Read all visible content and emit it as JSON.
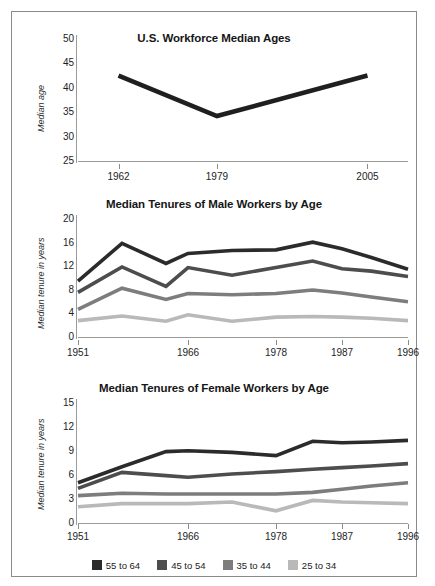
{
  "figure": {
    "border_color": "#8a8a8a",
    "background": "#ffffff"
  },
  "series_colors": {
    "55 to 64": "#2b2b2b",
    "45 to 54": "#4d4d4d",
    "35 to 44": "#7d7d7d",
    "25 to 34": "#b9b9b9",
    "single": "#1f1f1f"
  },
  "legend": {
    "position": "bottom",
    "items": [
      {
        "label": "55 to 64",
        "color": "#2b2b2b"
      },
      {
        "label": "45 to 54",
        "color": "#4d4d4d"
      },
      {
        "label": "35 to 44",
        "color": "#7d7d7d"
      },
      {
        "label": "25 to 34",
        "color": "#b9b9b9"
      }
    ]
  },
  "chart_data": [
    {
      "type": "line",
      "title": "U.S. Workforce Median Ages",
      "xlabel": "",
      "ylabel": "Median age",
      "x": [
        1962,
        1979,
        2005
      ],
      "xticks": [
        1962,
        1979,
        2005
      ],
      "xticklabels": [
        "1962",
        "1979",
        "2005"
      ],
      "yticks": [
        25,
        30,
        35,
        40,
        45,
        50
      ],
      "yticklabels": [
        "25",
        "30",
        "35",
        "40",
        "45",
        "50"
      ],
      "ylim": [
        25,
        50
      ],
      "xlim": [
        1955,
        2012
      ],
      "grid": false,
      "series": [
        {
          "name": "Median age",
          "color": "#1f1f1f",
          "values": [
            42.3,
            34.0,
            42.3
          ]
        }
      ]
    },
    {
      "type": "line",
      "title": "Median Tenures of Male Workers by Age",
      "xlabel": "",
      "ylabel": "Median tenure in years",
      "x": [
        1951,
        1957,
        1963,
        1966,
        1972,
        1978,
        1983,
        1987,
        1991,
        1996
      ],
      "xticks": [
        1951,
        1966,
        1978,
        1987,
        1996
      ],
      "xticklabels": [
        "1951",
        "1966",
        "1978",
        "1987",
        "1996"
      ],
      "yticks": [
        0,
        4,
        8,
        12,
        16,
        20
      ],
      "yticklabels": [
        "0",
        "4",
        "8",
        "12",
        "16",
        "20"
      ],
      "ylim": [
        0,
        20
      ],
      "grid": false,
      "series": [
        {
          "name": "55 to 64",
          "color": "#2b2b2b",
          "values": [
            9.3,
            15.7,
            12.3,
            14.0,
            14.5,
            14.6,
            15.9,
            14.8,
            13.3,
            11.3
          ]
        },
        {
          "name": "45 to 54",
          "color": "#4d4d4d",
          "values": [
            7.4,
            11.7,
            8.4,
            11.6,
            10.3,
            11.6,
            12.7,
            11.4,
            11.0,
            10.1
          ]
        },
        {
          "name": "35 to 44",
          "color": "#7d7d7d",
          "values": [
            4.5,
            8.1,
            6.2,
            7.2,
            7.0,
            7.2,
            7.8,
            7.3,
            6.6,
            5.8
          ]
        },
        {
          "name": "25 to 34",
          "color": "#b9b9b9",
          "values": [
            2.6,
            3.4,
            2.5,
            3.6,
            2.5,
            3.2,
            3.3,
            3.2,
            3.0,
            2.6
          ]
        }
      ]
    },
    {
      "type": "line",
      "title": "Median Tenures of Female Workers by Age",
      "xlabel": "",
      "ylabel": "Median tenure in years",
      "x": [
        1951,
        1957,
        1963,
        1966,
        1972,
        1978,
        1983,
        1987,
        1991,
        1996
      ],
      "xticks": [
        1951,
        1966,
        1978,
        1987,
        1996
      ],
      "xticklabels": [
        "1951",
        "1966",
        "1978",
        "1987",
        "1996"
      ],
      "yticks": [
        0,
        3,
        6,
        9,
        12,
        15
      ],
      "yticklabels": [
        "0",
        "3",
        "6",
        "9",
        "12",
        "15"
      ],
      "ylim": [
        0,
        15
      ],
      "grid": false,
      "series": [
        {
          "name": "55 to 64",
          "color": "#2b2b2b",
          "values": [
            4.9,
            6.9,
            8.8,
            8.9,
            8.7,
            8.3,
            10.1,
            9.9,
            10.0,
            10.2
          ]
        },
        {
          "name": "45 to 54",
          "color": "#4d4d4d",
          "values": [
            4.2,
            6.2,
            5.8,
            5.6,
            6.0,
            6.3,
            6.6,
            6.8,
            7.0,
            7.3
          ]
        },
        {
          "name": "35 to 44",
          "color": "#7d7d7d",
          "values": [
            3.3,
            3.6,
            3.5,
            3.5,
            3.5,
            3.5,
            3.7,
            4.1,
            4.5,
            4.9
          ]
        },
        {
          "name": "25 to 34",
          "color": "#b9b9b9",
          "values": [
            1.9,
            2.3,
            2.3,
            2.3,
            2.5,
            1.4,
            2.7,
            2.5,
            2.4,
            2.3
          ]
        }
      ]
    }
  ]
}
